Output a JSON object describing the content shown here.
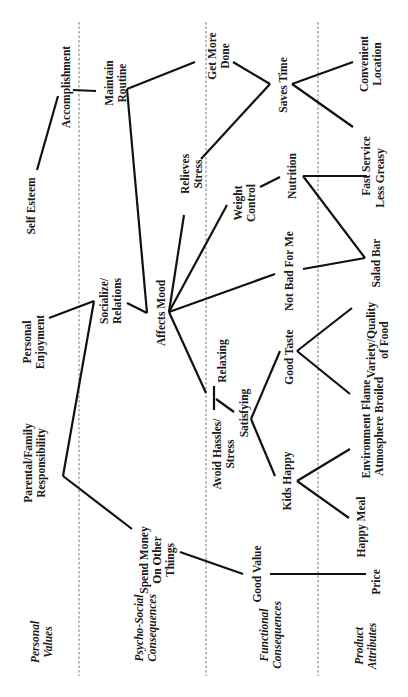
{
  "diagram": {
    "levels": [
      {
        "id": "values",
        "label": "Personal\nValues"
      },
      {
        "id": "psycho",
        "label": "Psycho-Social\nConsequences"
      },
      {
        "id": "functional",
        "label": "Functional\nConsequences"
      },
      {
        "id": "attributes",
        "label": "Product\nAttributes"
      }
    ],
    "nodes": {
      "self_esteem": "Self Esteem",
      "accomplishment": "Accomplishment",
      "personal_enjoyment": "Personal\nEnjoyment",
      "parental_family": "Parental/Family\nResponsibility",
      "maintain_routine": "Maintain\nRoutine",
      "get_more_done": "Get More\nDone",
      "relieves_stress": "Relieves\nStress",
      "socialize": "Socialize/\nRelations",
      "affects_mood": "Affects Mood",
      "relaxing": "Relaxing",
      "avoid_hassles": "Avoid Hassles/\nStress",
      "spend_money": "Spend Money\nOn Other\nThings",
      "saves_time": "Saves Time",
      "weight_control": "Weight\nControl",
      "nutrition": "Nutrition",
      "not_bad": "Not Bad For Me",
      "good_taste": "Good Taste",
      "satisfying": "Satisfying",
      "kids_happy": "Kids Happy",
      "good_value": "Good Value",
      "convenient_location": "Convenient\nLocation",
      "fast_service": "Fast Service",
      "less_greasy": "Less Greasy",
      "salad_bar": "Salad Bar",
      "variety_quality": "Variety/Quality\nof Food",
      "flame_broiled": "Flame\nBroiled",
      "environment": "Environment\nAtmosphere",
      "happy_meal": "Happy Meal",
      "price": "Price"
    },
    "links": [
      [
        "self_esteem",
        "accomplishment"
      ],
      [
        "accomplishment",
        "maintain_routine"
      ],
      [
        "maintain_routine",
        "get_more_done"
      ],
      [
        "maintain_routine",
        "affects_mood"
      ],
      [
        "get_more_done",
        "saves_time"
      ],
      [
        "relieves_stress",
        "saves_time"
      ],
      [
        "saves_time",
        "convenient_location"
      ],
      [
        "saves_time",
        "fast_service"
      ],
      [
        "personal_enjoyment",
        "socialize"
      ],
      [
        "socialize",
        "parental_family"
      ],
      [
        "socialize",
        "affects_mood"
      ],
      [
        "affects_mood",
        "relieves_stress"
      ],
      [
        "affects_mood",
        "weight_control"
      ],
      [
        "affects_mood",
        "not_bad"
      ],
      [
        "affects_mood",
        "relaxing"
      ],
      [
        "weight_control",
        "nutrition"
      ],
      [
        "nutrition",
        "less_greasy"
      ],
      [
        "nutrition",
        "salad_bar"
      ],
      [
        "not_bad",
        "salad_bar"
      ],
      [
        "relaxing",
        "avoid_hassles"
      ],
      [
        "avoid_hassles",
        "satisfying"
      ],
      [
        "satisfying",
        "good_taste"
      ],
      [
        "satisfying",
        "kids_happy"
      ],
      [
        "good_taste",
        "variety_quality"
      ],
      [
        "good_taste",
        "flame_broiled"
      ],
      [
        "kids_happy",
        "environment"
      ],
      [
        "kids_happy",
        "happy_meal"
      ],
      [
        "parental_family",
        "spend_money"
      ],
      [
        "spend_money",
        "good_value"
      ],
      [
        "good_value",
        "price"
      ]
    ]
  }
}
